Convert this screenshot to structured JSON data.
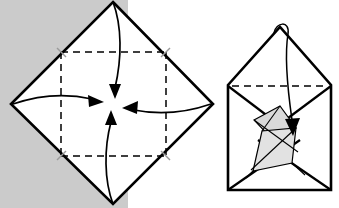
{
  "page": {
    "kind": "origami-instruction-diagram",
    "background_color": "#ffffff",
    "left_margin_color": "#c8c8c8",
    "ink_color": "#000000",
    "shade_color": "#d9d9d9",
    "cropped_caption_text": "",
    "width": 339,
    "height": 208
  },
  "panels": [
    {
      "id": "left-panel",
      "name": "square-with-center-folds",
      "shape": "diamond",
      "description": "Square sheet rotated 45 degrees with dashed crease lines forming an inner square; four arrows fold each corner to the center.",
      "outline_points": "113,2 213,104 113,204 11,104",
      "vertices": {
        "top": [
          113,
          2
        ],
        "right": [
          213,
          104
        ],
        "bottom": [
          113,
          204
        ],
        "left": [
          11,
          104
        ],
        "center": [
          113,
          104
        ]
      },
      "crease_square": {
        "style": "dashed",
        "left": 61,
        "top": 52,
        "right": 166,
        "bottom": 156
      },
      "arrows": [
        {
          "name": "fold-arrow-top",
          "from": [
            113,
            10
          ],
          "to": [
            113,
            95
          ],
          "direction": "down"
        },
        {
          "name": "fold-arrow-bottom",
          "from": [
            113,
            198
          ],
          "to": [
            113,
            113
          ],
          "direction": "up"
        },
        {
          "name": "fold-arrow-left",
          "from": [
            16,
            102
          ],
          "to": [
            101,
            104
          ],
          "direction": "right"
        },
        {
          "name": "fold-arrow-right",
          "from": [
            208,
            106
          ],
          "to": [
            124,
            106
          ],
          "direction": "left"
        }
      ]
    },
    {
      "id": "right-panel",
      "name": "folded-envelope-result",
      "shape": "house-envelope",
      "description": "Result of the fold: an envelope/house form with a peaked top flap, a dashed horizontal crease, shaded interior flaps and a curved arrow tucking the top point into the center.",
      "outline_points": "228,85 280,27 331,85 331,190 228,190",
      "body_rect": {
        "left": 228,
        "top": 85,
        "right": 331,
        "bottom": 190
      },
      "apex": [
        280,
        27
      ],
      "crease_dashed_line": {
        "from": [
          232,
          86
        ],
        "to": [
          328,
          86
        ],
        "style": "dashed"
      },
      "curved_arrow": {
        "name": "tuck-arrow",
        "loop_at": [
          280,
          25
        ],
        "tip": [
          293,
          134
        ],
        "direction": "down-into-center"
      }
    }
  ]
}
